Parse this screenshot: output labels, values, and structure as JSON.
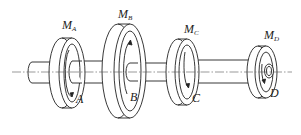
{
  "diagram": {
    "colors": {
      "line": "#222222",
      "background": "#ffffff",
      "centerline": "#555555"
    },
    "torques": [
      {
        "symbol": "M",
        "subscript": "A"
      },
      {
        "symbol": "M",
        "subscript": "B"
      },
      {
        "symbol": "M",
        "subscript": "C"
      },
      {
        "symbol": "M",
        "subscript": "D"
      }
    ],
    "discs": [
      {
        "label": "A"
      },
      {
        "label": "B"
      },
      {
        "label": "C"
      },
      {
        "label": "D"
      }
    ]
  }
}
